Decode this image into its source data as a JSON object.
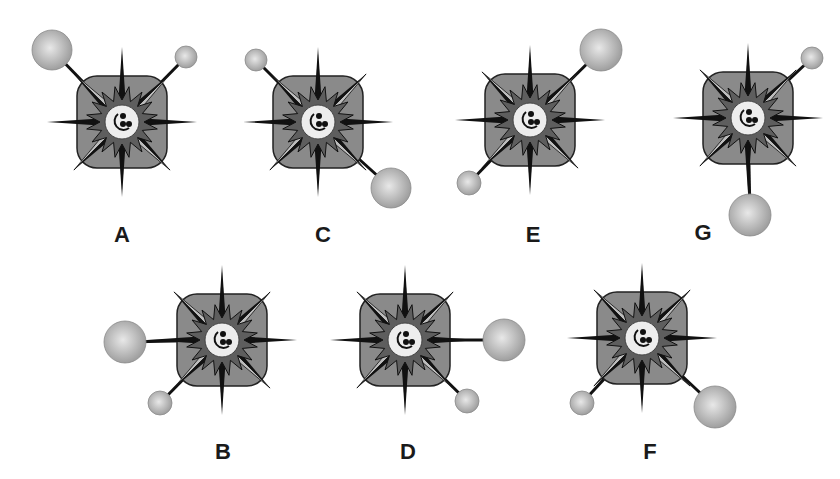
{
  "figures": [
    {
      "label": "A",
      "cx": 122,
      "cy": 122,
      "label_x": 122,
      "label_y": 235,
      "balls": [
        {
          "size": "large",
          "x": 52,
          "y": 50,
          "r": 20
        },
        {
          "size": "small",
          "x": 186,
          "y": 57,
          "r": 11
        }
      ]
    },
    {
      "label": "C",
      "cx": 318,
      "cy": 122,
      "label_x": 323,
      "label_y": 235,
      "balls": [
        {
          "size": "small",
          "x": 256,
          "y": 60,
          "r": 11
        },
        {
          "size": "large",
          "x": 391,
          "y": 188,
          "r": 20
        }
      ]
    },
    {
      "label": "E",
      "cx": 530,
      "cy": 120,
      "label_x": 533,
      "label_y": 235,
      "balls": [
        {
          "size": "large",
          "x": 601,
          "y": 50,
          "r": 21
        },
        {
          "size": "small",
          "x": 469,
          "y": 183,
          "r": 12
        }
      ]
    },
    {
      "label": "G",
      "cx": 748,
      "cy": 118,
      "label_x": 703,
      "label_y": 233,
      "balls": [
        {
          "size": "small",
          "x": 812,
          "y": 58,
          "r": 11
        },
        {
          "size": "large",
          "x": 750,
          "y": 215,
          "r": 21
        }
      ]
    },
    {
      "label": "B",
      "cx": 222,
      "cy": 340,
      "label_x": 223,
      "label_y": 452,
      "balls": [
        {
          "size": "large",
          "x": 125,
          "y": 342,
          "r": 21
        },
        {
          "size": "small",
          "x": 160,
          "y": 403,
          "r": 12
        }
      ]
    },
    {
      "label": "D",
      "cx": 405,
      "cy": 340,
      "label_x": 408,
      "label_y": 452,
      "balls": [
        {
          "size": "large",
          "x": 504,
          "y": 340,
          "r": 21
        },
        {
          "size": "small",
          "x": 467,
          "y": 401,
          "r": 12
        }
      ]
    },
    {
      "label": "F",
      "cx": 642,
      "cy": 338,
      "label_x": 650,
      "label_y": 452,
      "balls": [
        {
          "size": "small",
          "x": 582,
          "y": 403,
          "r": 12
        },
        {
          "size": "large",
          "x": 715,
          "y": 407,
          "r": 21
        }
      ]
    }
  ],
  "colors": {
    "square_fill": "#8a8a8a",
    "square_stroke": "#222222",
    "spike_dark": "#111111",
    "spike_light": "#bdbdbd",
    "inner_star": "#5e5e5e",
    "center_fill": "#ededed",
    "ball_light": "#e6e6e6",
    "ball_dark": "#9a9a9a"
  }
}
